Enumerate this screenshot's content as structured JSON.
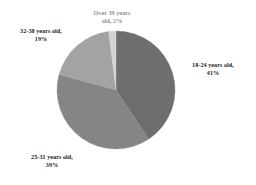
{
  "chart_data": {
    "type": "pie",
    "title": "",
    "subtitle": "",
    "xlabel": "",
    "ylabel": "",
    "legend_position": "none",
    "grid": false,
    "start_angle_deg": 0,
    "direction": "clockwise",
    "categories": [
      "18-24 years old",
      "25-31 years old",
      "32-38 years old",
      "Over 39 years old"
    ],
    "values": [
      41,
      39,
      19,
      2
    ],
    "value_unit": "%",
    "colors": [
      "#6e6e6e",
      "#858585",
      "#a3a3a3",
      "#d4d4d4"
    ],
    "slices": [
      {
        "name": "18-24 years old",
        "value": 41,
        "label_line1": "18-24 years old,",
        "label_line2": "41%",
        "color": "#6e6e6e",
        "label_color": "#1a1a1a"
      },
      {
        "name": "25-31 years old",
        "value": 39,
        "label_line1": "25-31 years old,",
        "label_line2": "39%",
        "color": "#858585",
        "label_color": "#1a1a1a"
      },
      {
        "name": "32-38 years old",
        "value": 19,
        "label_line1": "32-38 years old,",
        "label_line2": "19%",
        "color": "#a3a3a3",
        "label_color": "#1a1a1a"
      },
      {
        "name": "Over 39 years old",
        "value": 2,
        "label_line1": "Over 39 years",
        "label_line2": "old, 2%",
        "color": "#d4d4d4",
        "label_color": "#8d8d8d"
      }
    ]
  },
  "geometry": {
    "center_x": 116,
    "center_y": 90,
    "radius": 59
  },
  "canvas": {
    "background": "#ffffff",
    "width": 256,
    "height": 185
  }
}
